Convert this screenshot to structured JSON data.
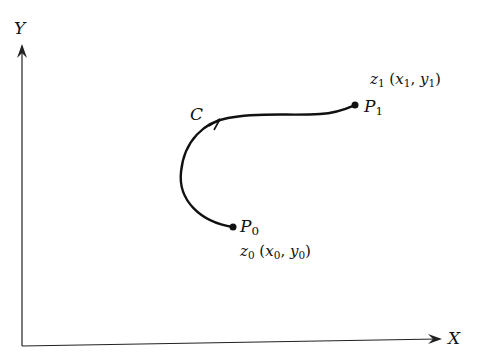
{
  "diagram": {
    "axes": {
      "y_label": "Y",
      "x_label": "X"
    },
    "curve": {
      "label": "C"
    },
    "points": {
      "start": {
        "name": "P",
        "sub": "0",
        "coord_name": "z",
        "coord_sub": "0",
        "coord_text_open": " (",
        "x": "x",
        "x_sub": "0",
        "sep": ", ",
        "y": "y",
        "y_sub": "0",
        "close": ")"
      },
      "end": {
        "name": "P",
        "sub": "1",
        "coord_name": "z",
        "coord_sub": "1",
        "coord_text_open": " (",
        "x": "x",
        "x_sub": "1",
        "sep": ", ",
        "y": "y",
        "y_sub": "1",
        "close": ")"
      }
    },
    "colors": {
      "ink": "#111111",
      "background": "#ffffff"
    }
  }
}
